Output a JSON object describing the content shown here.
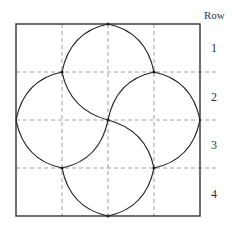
{
  "diagram": {
    "header_label": "Row",
    "rows": [
      {
        "label": "1"
      },
      {
        "label": "2"
      },
      {
        "label": "3"
      },
      {
        "label": "4"
      }
    ],
    "grid": {
      "columns": 4,
      "rows": 4
    },
    "colors": {
      "outline": "#222222",
      "gridline": "#777777",
      "curve": "#222222"
    }
  }
}
